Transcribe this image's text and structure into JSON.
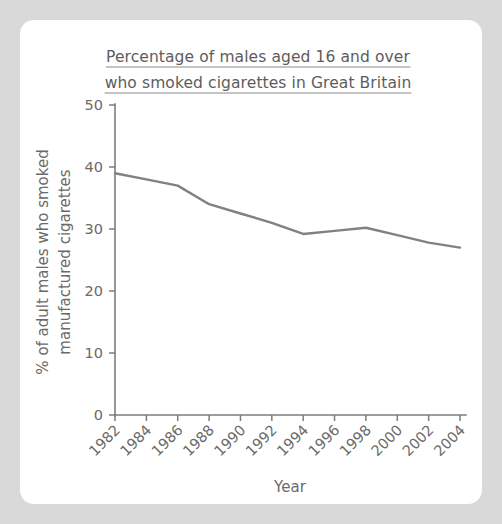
{
  "card": {
    "background": "#ffffff",
    "page_background": "#d9d9d9"
  },
  "chart_data": {
    "type": "line",
    "title_line1": "Percentage of males aged 16 and over",
    "title_line2": "who smoked cigarettes in Great Britain",
    "xlabel": "Year",
    "ylabel_line1": "% of adult males who smoked",
    "ylabel_line2": "manufactured cigarettes",
    "categories": [
      1982,
      1984,
      1986,
      1988,
      1990,
      1992,
      1994,
      1996,
      1998,
      2000,
      2002,
      2004
    ],
    "xtick_labels": [
      "1982",
      "1984",
      "1986",
      "1988",
      "1990",
      "1992",
      "1994",
      "1996",
      "1998",
      "2000",
      "2002",
      "2004"
    ],
    "ytick_labels": [
      "0",
      "10",
      "20",
      "30",
      "40",
      "50"
    ],
    "ytick_values": [
      0,
      10,
      20,
      30,
      40,
      50
    ],
    "values": [
      39,
      38,
      37,
      34,
      32.5,
      31,
      29.2,
      29.7,
      30.2,
      29,
      27.8,
      27
    ],
    "series": [
      {
        "name": "% of adult males who smoked manufactured cigarettes",
        "color": "#818181",
        "values": [
          39,
          38,
          37,
          34,
          32.5,
          31,
          29.2,
          29.7,
          30.2,
          29,
          27.8,
          27
        ]
      }
    ],
    "xlim": [
      1982,
      2004
    ],
    "ylim": [
      0,
      50
    ],
    "grid": false,
    "legend": "none",
    "line_color": "#818181",
    "axis_color": "#7d7d7d",
    "text_color": "#6a6a6a"
  }
}
